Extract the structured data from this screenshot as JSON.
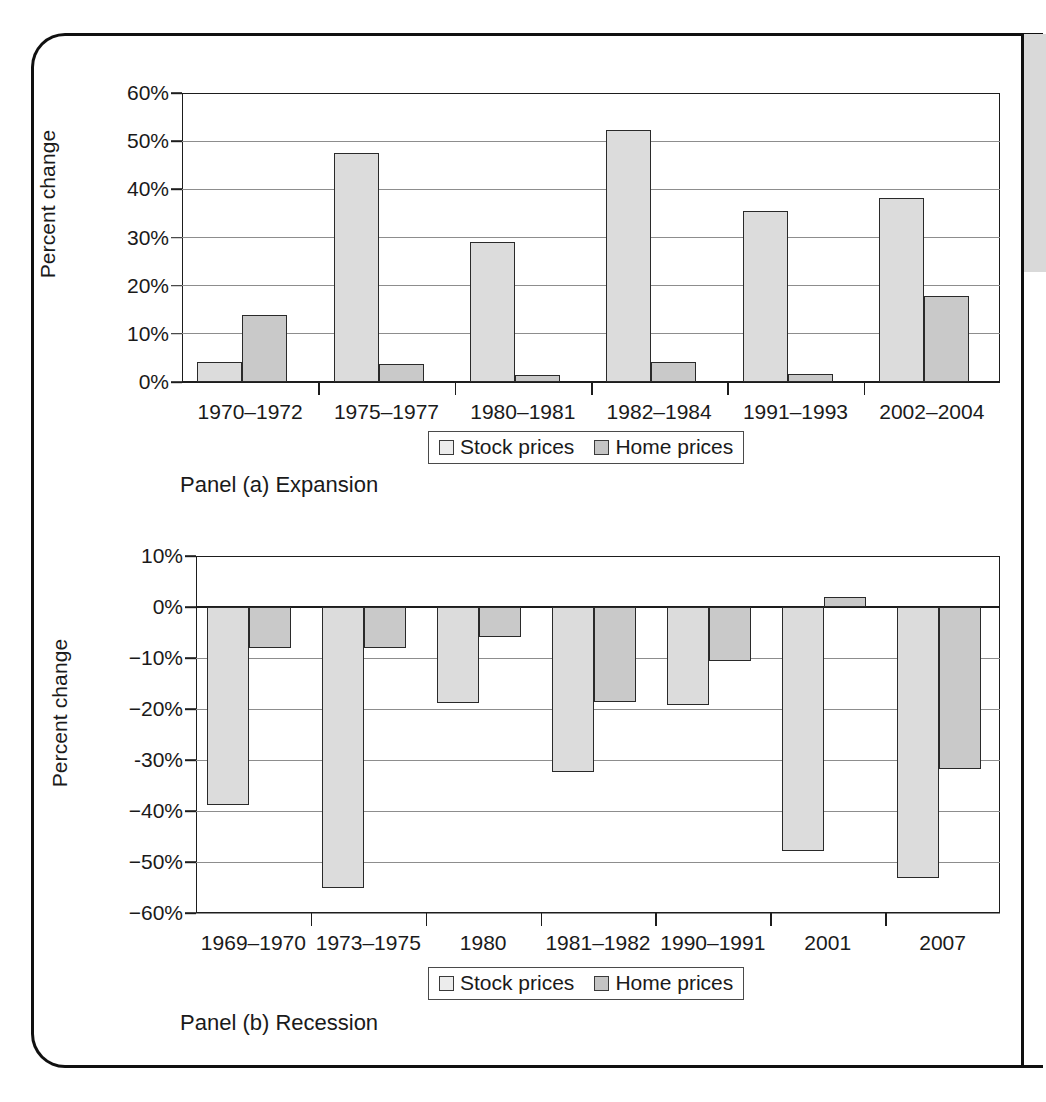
{
  "figure": {
    "panels": [
      {
        "id": "a",
        "caption": "Panel (a) Expansion",
        "ylabel": "Percent change",
        "legend": {
          "stock_label": "Stock prices",
          "home_label": "Home prices"
        }
      },
      {
        "id": "b",
        "caption": "Panel (b) Recession",
        "ylabel": "Percent change",
        "legend": {
          "stock_label": "Stock prices",
          "home_label": "Home prices"
        }
      }
    ],
    "colors": {
      "stock_fill": "#dcdcdc",
      "home_fill": "#c9c9c9",
      "bar_border": "#2a2a2a",
      "gridline": "#8d8d8d",
      "axis": "#1d1d1d",
      "frame": "#101010",
      "right_strip": "#d9d9d9"
    }
  },
  "chart_data": [
    {
      "type": "bar",
      "title": "Panel (a) Expansion",
      "xlabel": "",
      "ylabel": "Percent change",
      "categories": [
        "1970–1972",
        "1975–1977",
        "1980–1981",
        "1982–1984",
        "1991–1993",
        "2002–2004"
      ],
      "series": [
        {
          "name": "Stock prices",
          "values": [
            4.2,
            47.5,
            29.0,
            52.3,
            35.6,
            38.2
          ]
        },
        {
          "name": "Home prices",
          "values": [
            13.9,
            3.8,
            1.4,
            4.1,
            1.7,
            17.9
          ]
        }
      ],
      "ylim": [
        0,
        60
      ],
      "yticks": [
        0,
        10,
        20,
        30,
        40,
        50,
        60
      ],
      "ytick_labels": [
        "0%",
        "10%",
        "20%",
        "30%",
        "40%",
        "50%",
        "60%"
      ],
      "grid": true,
      "legend_position": "bottom"
    },
    {
      "type": "bar",
      "title": "Panel (b) Recession",
      "xlabel": "",
      "ylabel": "Percent change",
      "categories": [
        "1969–1970",
        "1973–1975",
        "1980",
        "1981–1982",
        "1990–1991",
        "2001",
        "2007"
      ],
      "series": [
        {
          "name": "Stock prices",
          "values": [
            -38.9,
            -55.0,
            -18.8,
            -32.4,
            -19.3,
            -47.8,
            -53.2
          ]
        },
        {
          "name": "Home prices",
          "values": [
            -8.1,
            -8.1,
            -5.8,
            -18.7,
            -10.5,
            1.9,
            -31.8
          ]
        }
      ],
      "ylim": [
        -60,
        10
      ],
      "yticks": [
        10,
        0,
        -10,
        -20,
        -30,
        -40,
        -50,
        -60
      ],
      "ytick_labels": [
        "10%",
        "0%",
        "−10%",
        "−20%",
        "-30%",
        "−40%",
        "−50%",
        "−60%"
      ],
      "grid": true,
      "legend_position": "bottom"
    }
  ]
}
